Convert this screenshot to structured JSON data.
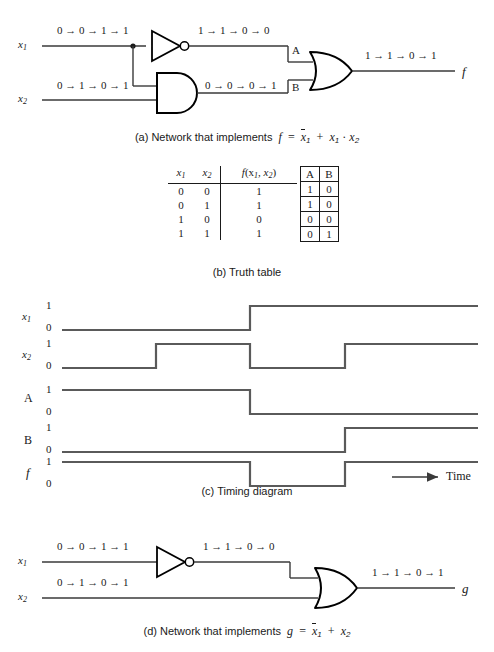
{
  "figure": {
    "line_color": "#3a3a3a",
    "gate_color": "#000000",
    "text_color": "#1a1a1a"
  },
  "panel_a": {
    "caption_prefix": "(a) Network that  implements",
    "caption_f": "f",
    "caption_eq": "=",
    "caption_notx1": "x",
    "caption_notx1_sub": "1",
    "caption_plus": "+",
    "caption_x1": "x",
    "caption_x1_sub": "1",
    "caption_dot": "·",
    "caption_x2": "x",
    "caption_x2_sub": "2",
    "input1_label": "x",
    "input1_sub": "1",
    "input2_label": "x",
    "input2_sub": "2",
    "output_label": "f",
    "wire_x1_value": "0 → 0 → 1 → 1",
    "wire_x2_value": "0 → 1 → 0 → 1",
    "wire_not_value": "1 → 1 → 0 → 0",
    "wire_and_value": "0 → 0 → 0 → 1",
    "wire_f_value": "1 → 1 → 0 → 1",
    "node_a_label": "A",
    "node_b_label": "B",
    "gate_not": "not-gate",
    "gate_and": "and-gate",
    "gate_or": "or-gate"
  },
  "panel_b": {
    "caption": "(b) Truth table",
    "headers": {
      "x1": "x",
      "x1_sub": "1",
      "x2": "x",
      "x2_sub": "2",
      "f": "f",
      "f_args_open": "(x",
      "f_arg1_sub": "1",
      "f_comma": ", x",
      "f_arg2_sub": "2",
      "f_args_close": ")",
      "a": "A",
      "b": "B"
    },
    "rows": [
      {
        "x1": "0",
        "x2": "0",
        "f": "1",
        "a": "1",
        "b": "0"
      },
      {
        "x1": "0",
        "x2": "1",
        "f": "1",
        "a": "1",
        "b": "0"
      },
      {
        "x1": "1",
        "x2": "0",
        "f": "0",
        "a": "0",
        "b": "0"
      },
      {
        "x1": "1",
        "x2": "1",
        "f": "1",
        "a": "0",
        "b": "1"
      }
    ]
  },
  "panel_c": {
    "caption": "(c) Timing diagram",
    "time_label": "Time",
    "level_high": "1",
    "level_low": "0",
    "signals": [
      {
        "name": "x",
        "sub": "1",
        "levels": [
          0,
          0,
          1,
          1
        ]
      },
      {
        "name": "x",
        "sub": "2",
        "levels": [
          0,
          1,
          0,
          1
        ]
      },
      {
        "name": "A",
        "sub": "",
        "levels": [
          1,
          1,
          0,
          0
        ]
      },
      {
        "name": "B",
        "sub": "",
        "levels": [
          0,
          0,
          0,
          1
        ]
      },
      {
        "name": "f",
        "sub": "",
        "levels": [
          1,
          1,
          0,
          1
        ]
      }
    ],
    "time_slots": 4
  },
  "panel_d": {
    "caption_prefix": "(d) Network that implements",
    "caption_g": "g",
    "caption_eq": "=",
    "caption_notx1": "x",
    "caption_notx1_sub": "1",
    "caption_plus": "+",
    "caption_x2": "x",
    "caption_x2_sub": "2",
    "input1_label": "x",
    "input1_sub": "1",
    "input2_label": "x",
    "input2_sub": "2",
    "output_label": "g",
    "wire_x1_value": "0 → 0 → 1 → 1",
    "wire_x2_value": "0 → 1 → 0 → 1",
    "wire_not_value": "1 → 1 → 0 → 0",
    "wire_g_value": "1 → 1 → 0 → 1",
    "gate_not": "not-gate",
    "gate_or": "or-gate"
  }
}
